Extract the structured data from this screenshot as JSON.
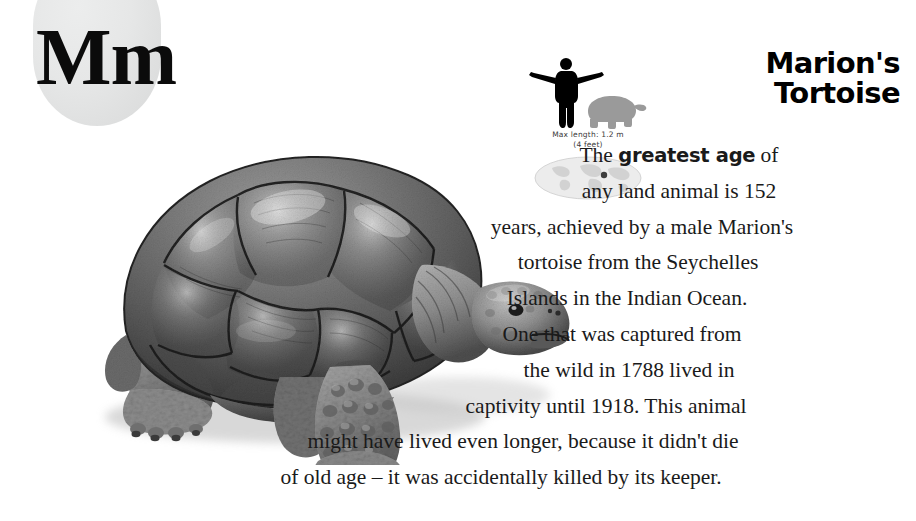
{
  "page": {
    "background_color": "#ffffff",
    "width": 916,
    "height": 521
  },
  "letter_badge": {
    "letters": "Mm",
    "shape": "rounded-gray-tab",
    "fill_color": "#e4e5e5",
    "text_color": "#0b0b0b"
  },
  "illustration": {
    "subject": "galapagos-tortoise",
    "style": "grayscale-photo-illustration",
    "alt": "A large grey tortoise in profile facing right, with a high domed shell, scaly wrinkled legs and an outstretched neck"
  },
  "scale_panel": {
    "human_silhouette_color": "#000000",
    "animal_silhouette_color": "#9a9a9a",
    "caption_line1": "Max length: 1.2 m",
    "caption_line2": "(4 feet)",
    "map": {
      "shape": "oval-world-map",
      "fill_color": "#e9e9e9",
      "marker_color": "#3d3d3d",
      "marker_label": "Seychelles Islands"
    }
  },
  "article": {
    "title_line1": "Marion's",
    "title_line2": "Tortoise",
    "body_lines": [
      {
        "pre": "The ",
        "bold": "greatest age",
        "post": " of"
      },
      {
        "pre": "any land animal is 152",
        "bold": "",
        "post": ""
      },
      {
        "pre": "years, achieved by a male Marion's",
        "bold": "",
        "post": ""
      },
      {
        "pre": "tortoise from the Seychelles",
        "bold": "",
        "post": ""
      },
      {
        "pre": "Islands in the Indian Ocean.",
        "bold": "",
        "post": ""
      },
      {
        "pre": "One that was captured from",
        "bold": "",
        "post": ""
      },
      {
        "pre": "the wild in 1788 lived in",
        "bold": "",
        "post": ""
      },
      {
        "pre": "captivity until 1918. This animal",
        "bold": "",
        "post": ""
      },
      {
        "pre": "might have lived even longer, because it didn't die",
        "bold": "",
        "post": ""
      },
      {
        "pre": "of old age – it was accidentally killed by its keeper.",
        "bold": "",
        "post": ""
      }
    ]
  }
}
